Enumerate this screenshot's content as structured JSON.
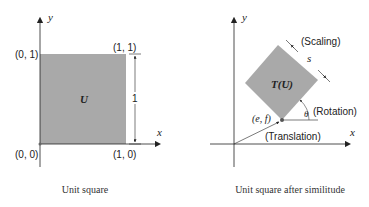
{
  "left_panel": {
    "caption": "Unit square",
    "x_axis_label": "x",
    "y_axis_label": "y",
    "shape_label": "U",
    "corner_labels": {
      "top_left": "(0, 1)",
      "top_right": "(1, 1)",
      "bottom_left": "(0, 0)",
      "bottom_right": "(1, 0)"
    },
    "dimension_label": "1"
  },
  "right_panel": {
    "caption": "Unit square after similitude",
    "x_axis_label": "x",
    "y_axis_label": "y",
    "shape_label": "T(U)",
    "scaling_label": "(Scaling)",
    "scale_symbol": "s",
    "rotation_label": "(Rotation)",
    "angle_symbol": "θ",
    "translation_label": "(Translation)",
    "point_label": "(e, f)"
  },
  "colors": {
    "fill": "#a9a9a9",
    "axis": "#222222"
  }
}
